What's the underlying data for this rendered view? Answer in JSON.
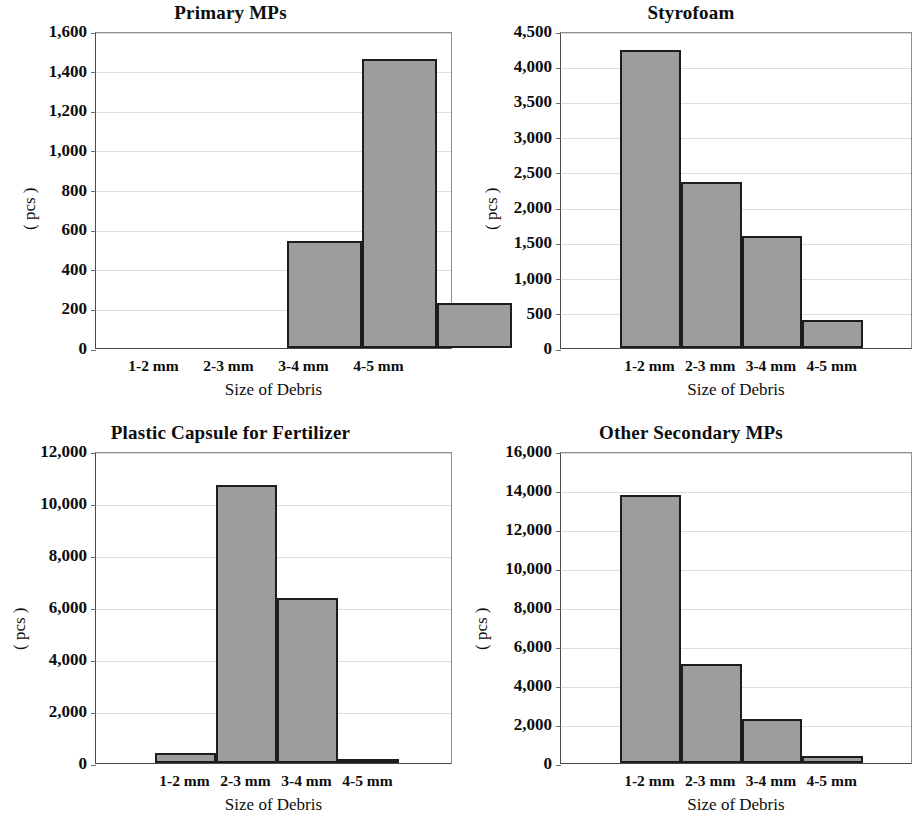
{
  "figure": {
    "background": "#ffffff",
    "bar_fill": "#9d9d9d",
    "bar_stroke": "#1d1d1d",
    "grid_color": "#dcdcdc",
    "axis_color": "#4a4a4a"
  },
  "chart_data": [
    {
      "type": "bar",
      "title": "Primary MPs",
      "xlabel": "Size of Debris",
      "ylabel": "( pcs )",
      "categories": [
        "1-2 mm",
        "2-3 mm",
        "3-4 mm",
        "4-5 mm"
      ],
      "values": [
        0,
        540,
        1460,
        225
      ],
      "ylim": [
        0,
        1600
      ],
      "yticks": [
        0,
        200,
        400,
        600,
        800,
        1000,
        1200,
        1400,
        1600
      ],
      "ytick_labels": [
        "0",
        "200",
        "400",
        "600",
        "800",
        "1,000",
        "1,200",
        "1,400",
        "1,600"
      ],
      "grid": true,
      "legend": "none"
    },
    {
      "type": "bar",
      "title": "Styrofoam",
      "xlabel": "Size of Debris",
      "ylabel": "( pcs )",
      "categories": [
        "1-2 mm",
        "2-3 mm",
        "3-4 mm",
        "4-5 mm"
      ],
      "values": [
        4230,
        2360,
        1590,
        400
      ],
      "ylim": [
        0,
        4500
      ],
      "yticks": [
        0,
        500,
        1000,
        1500,
        2000,
        2500,
        3000,
        3500,
        4000,
        4500
      ],
      "ytick_labels": [
        "0",
        "500",
        "1,000",
        "1,500",
        "2,000",
        "2,500",
        "3,000",
        "3,500",
        "4,000",
        "4,500"
      ],
      "grid": true,
      "legend": "none"
    },
    {
      "type": "bar",
      "title": "Plastic Capsule for Fertilizer",
      "xlabel": "Size of Debris",
      "ylabel": "( pcs )",
      "categories": [
        "1-2 mm",
        "2-3 mm",
        "3-4 mm",
        "4-5 mm"
      ],
      "values": [
        380,
        10700,
        6350,
        90
      ],
      "ylim": [
        0,
        12000
      ],
      "yticks": [
        0,
        2000,
        4000,
        6000,
        8000,
        10000,
        12000
      ],
      "ytick_labels": [
        "0",
        "2,000",
        "4,000",
        "6,000",
        "8,000",
        "10,000",
        "12,000"
      ],
      "grid": true,
      "legend": "none"
    },
    {
      "type": "bar",
      "title": "Other Secondary MPs",
      "xlabel": "Size of Debris",
      "ylabel": "( pcs )",
      "categories": [
        "1-2 mm",
        "2-3 mm",
        "3-4 mm",
        "4-5 mm"
      ],
      "values": [
        13750,
        5100,
        2250,
        350
      ],
      "ylim": [
        0,
        16000
      ],
      "yticks": [
        0,
        2000,
        4000,
        6000,
        8000,
        10000,
        12000,
        14000,
        16000
      ],
      "ytick_labels": [
        "0",
        "2,000",
        "4,000",
        "6,000",
        "8,000",
        "10,000",
        "12,000",
        "14,000",
        "16,000"
      ],
      "grid": true,
      "legend": "none"
    }
  ]
}
